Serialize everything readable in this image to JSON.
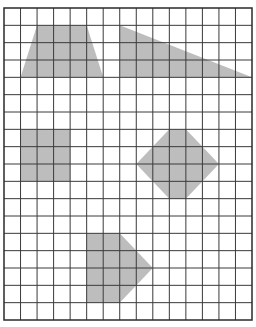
{
  "grid": {
    "columns": 15,
    "rows": 18,
    "line_color": "#3a3a3a",
    "fill_color": "#bdbdbd",
    "background_color": "#ffffff"
  },
  "shapes": [
    {
      "name": "trapezoid",
      "vertices": [
        [
          2,
          1
        ],
        [
          5,
          1
        ],
        [
          6,
          4
        ],
        [
          1,
          4
        ]
      ]
    },
    {
      "name": "right-triangle",
      "vertices": [
        [
          7,
          1
        ],
        [
          15,
          4
        ],
        [
          7,
          4
        ]
      ]
    },
    {
      "name": "square",
      "vertices": [
        [
          1,
          7
        ],
        [
          4,
          7
        ],
        [
          4,
          10
        ],
        [
          1,
          10
        ]
      ]
    },
    {
      "name": "hexagon",
      "vertices": [
        [
          10,
          7
        ],
        [
          11,
          7
        ],
        [
          13,
          9
        ],
        [
          11,
          11
        ],
        [
          10,
          11
        ],
        [
          8,
          9
        ]
      ]
    },
    {
      "name": "pentagon",
      "vertices": [
        [
          5,
          13
        ],
        [
          7,
          13
        ],
        [
          9,
          15
        ],
        [
          7,
          17
        ],
        [
          5,
          17
        ]
      ]
    }
  ]
}
